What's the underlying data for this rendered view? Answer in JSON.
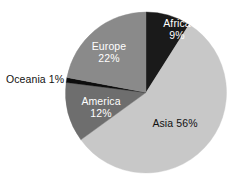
{
  "chart_data": {
    "type": "pie",
    "title": "",
    "subtitle": "",
    "xlabel": "",
    "ylabel": "",
    "legend_position": "none",
    "grid": false,
    "labels_on_slices": true,
    "unit": "%",
    "categories": [
      "Africa",
      "Asia",
      "America",
      "Oceania",
      "Europe"
    ],
    "values": [
      9,
      56,
      12,
      1,
      22
    ],
    "colors": [
      "#1a1a1a",
      "#c8c8c8",
      "#6e6e6e",
      "#0d0d0d",
      "#8a8a8a"
    ],
    "start_angle_deg": 0,
    "direction": "clockwise",
    "slices": [
      {
        "name": "Africa",
        "value": 9,
        "value_text": "9%",
        "color": "#1a1a1a",
        "label_text": "Africa",
        "label_placement": "inside",
        "label_color": "#ffffff"
      },
      {
        "name": "Asia",
        "value": 56,
        "value_text": "56%",
        "color": "#c8c8c8",
        "label_text": "Asia 56%",
        "label_placement": "inside",
        "label_color": "#111111"
      },
      {
        "name": "America",
        "value": 12,
        "value_text": "12%",
        "color": "#6e6e6e",
        "label_text": "America",
        "label_placement": "inside",
        "label_color": "#ffffff"
      },
      {
        "name": "Oceania",
        "value": 1,
        "value_text": "1%",
        "color": "#0d0d0d",
        "label_text": "Oceania 1%",
        "label_placement": "outside-left",
        "label_color": "#111111"
      },
      {
        "name": "Europe",
        "value": 22,
        "value_text": "22%",
        "color": "#8a8a8a",
        "label_text": "Europe",
        "label_placement": "inside",
        "label_color": "#ffffff"
      }
    ]
  },
  "labels": {
    "africa": {
      "name": "Africa",
      "value": "9%"
    },
    "europe": {
      "name": "Europe",
      "value": "22%"
    },
    "america": {
      "name": "America",
      "value": "12%"
    },
    "asia": {
      "name": "Asia",
      "value": " 56%"
    },
    "oceania": {
      "name": "Oceania",
      "value": " 1%"
    }
  },
  "background_color": "#ffffff"
}
